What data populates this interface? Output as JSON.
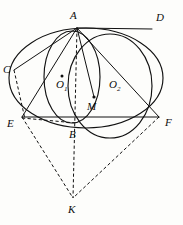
{
  "figure": {
    "type": "euclidean-geometry",
    "canvas": {
      "width": 183,
      "height": 225
    },
    "background_color": "#fdfdfb",
    "line_color": "#111111"
  },
  "points": {
    "A": {
      "label": "A",
      "x": 77,
      "y": 28,
      "label_x": 70,
      "label_y": 19
    },
    "B": {
      "label": "B",
      "x": 74,
      "y": 122,
      "label_x": 70,
      "label_y": 137
    },
    "C": {
      "label": "C",
      "x": 14,
      "y": 70,
      "label_x": 4,
      "label_y": 72
    },
    "D": {
      "label": "D",
      "x": 152,
      "y": 29,
      "label_x": 156,
      "label_y": 21
    },
    "E": {
      "label": "E",
      "x": 22,
      "y": 117,
      "label_x": 8,
      "label_y": 126
    },
    "F": {
      "label": "F",
      "x": 159,
      "y": 117,
      "label_x": 165,
      "label_y": 125
    },
    "K": {
      "label": "K",
      "x": 73,
      "y": 198,
      "label_x": 69,
      "label_y": 212
    },
    "M": {
      "label": "M",
      "x": 94,
      "y": 97,
      "label_x": 88,
      "label_y": 109
    },
    "O1": {
      "label": "O",
      "sub": "1",
      "x": 62,
      "y": 76,
      "label_x": 57,
      "label_y": 88
    },
    "O2": {
      "label": "O",
      "sub": "2",
      "x": 113,
      "y": 79,
      "label_x": 110,
      "label_y": 88
    }
  },
  "circles": [
    {
      "name": "large-circle",
      "center_x": 86,
      "center_y": 78,
      "radius_x": 77,
      "radius_y": 50,
      "style": "solid"
    },
    {
      "name": "small-circle-O1",
      "center_x": 72,
      "center_y": 77,
      "radius_x": 28,
      "radius_y": 46,
      "style": "solid"
    },
    {
      "name": "circle-O2",
      "center_x": 110,
      "center_y": 86,
      "radius_x": 42,
      "radius_y": 52,
      "style": "solid"
    }
  ],
  "segments": [
    {
      "name": "segment-AC",
      "from": "A",
      "to": "C",
      "style": "solid"
    },
    {
      "name": "segment-AD",
      "from": "A",
      "to": "D",
      "style": "solid"
    },
    {
      "name": "segment-AE",
      "from": "A",
      "to": "E",
      "style": "solid"
    },
    {
      "name": "segment-AF",
      "from": "A",
      "to": "F",
      "style": "solid"
    },
    {
      "name": "segment-AM",
      "from": "A",
      "to": "M",
      "style": "solid"
    },
    {
      "name": "segment-CE",
      "from": "C",
      "to": "E",
      "style": "dashed"
    },
    {
      "name": "segment-EF",
      "from": "E",
      "to": "F",
      "style": "solid"
    },
    {
      "name": "segment-EB",
      "from": "E",
      "to": "B",
      "style": "dashed"
    },
    {
      "name": "segment-AK",
      "from": "A",
      "to": "K",
      "style": "dashed"
    },
    {
      "name": "segment-EK",
      "from": "E",
      "to": "K",
      "style": "dashed"
    },
    {
      "name": "segment-FK",
      "from": "F",
      "to": "K",
      "style": "dashed"
    }
  ],
  "labels_order": [
    "A",
    "D",
    "C",
    "O1",
    "O2",
    "M",
    "E",
    "B",
    "F",
    "K"
  ]
}
